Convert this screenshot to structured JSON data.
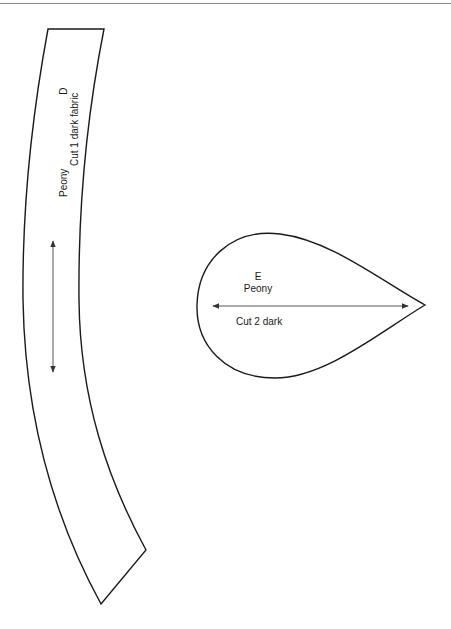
{
  "pieces": [
    {
      "id": "D",
      "letter": "D",
      "name": "Peony",
      "instruction": "Cut 1 dark fabric",
      "shape": "curved-band",
      "grainline": "vertical"
    },
    {
      "id": "E",
      "letter": "E",
      "name": "Peony",
      "instruction": "Cut 2 dark",
      "shape": "teardrop",
      "grainline": "horizontal"
    }
  ],
  "colors": {
    "outline": "#1a1a1a",
    "grainline": "#555555",
    "background": "#ffffff",
    "rule": "#8a8a8a"
  }
}
